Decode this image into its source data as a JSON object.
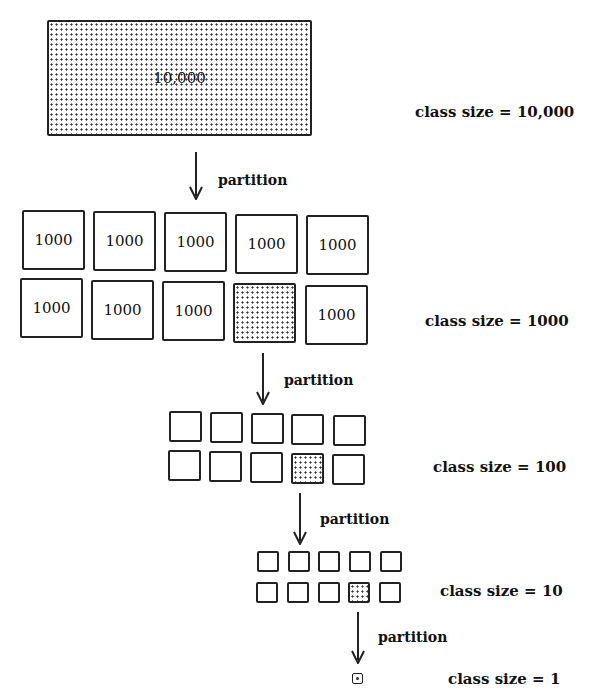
{
  "level0": {
    "value": "10,000",
    "label": "class size = 10,000",
    "highlighted": true
  },
  "partition_label": "partition",
  "level1": {
    "label": "class size = 1000",
    "row1": [
      "1000",
      "1000",
      "1000",
      "1000",
      "1000"
    ],
    "row2": [
      "1000",
      "1000",
      "1000",
      "",
      "1000"
    ],
    "highlighted_index": 8
  },
  "level2": {
    "label": "class size = 100",
    "count": 10,
    "highlighted_index": 8
  },
  "level3": {
    "label": "class size = 10",
    "count": 10,
    "highlighted_index": 8
  },
  "level4": {
    "label": "class size = 1",
    "count": 1
  },
  "arrows": [
    {
      "from": "level0",
      "to": "level1",
      "text": "partition"
    },
    {
      "from": "level1",
      "to": "level2",
      "text": "partition"
    },
    {
      "from": "level2",
      "to": "level3",
      "text": "partition"
    },
    {
      "from": "level3",
      "to": "level4",
      "text": "partition"
    }
  ]
}
